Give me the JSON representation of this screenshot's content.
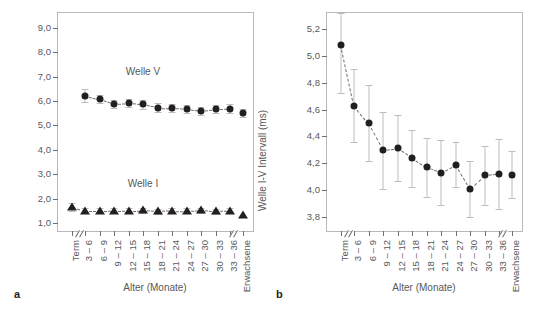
{
  "figure": {
    "panel_a_letter": "a",
    "panel_b_letter": "b"
  },
  "chart_data": [
    {
      "type": "scatter",
      "panel": "a",
      "title": "",
      "xlabel": "Alter (Monate)",
      "ylabel": "Latenz (ms)",
      "ylim": [
        0.6,
        9.6
      ],
      "yticks": [
        "1,0",
        "2,0",
        "3,0",
        "4,0",
        "5,0",
        "6,0",
        "7,0",
        "8,0",
        "9,0"
      ],
      "ytick_values": [
        1.0,
        2.0,
        3.0,
        4.0,
        5.0,
        6.0,
        7.0,
        8.0,
        9.0
      ],
      "grid": false,
      "legend_position": "inline-annotation",
      "axis_break_after_first": true,
      "axis_break_before_last": true,
      "categories": [
        "Term",
        "3 – 6",
        "6 – 9",
        "9 – 12",
        "12 – 15",
        "15 – 18",
        "18 – 21",
        "21 – 24",
        "24 – 27",
        "27 – 30",
        "30 – 33",
        "33 – 36",
        "Erwachsene"
      ],
      "series": [
        {
          "name": "Welle V",
          "marker": "circle",
          "annotation": "Welle V",
          "values": [
            null,
            6.22,
            6.08,
            5.88,
            5.91,
            5.86,
            5.73,
            5.71,
            5.68,
            5.6,
            5.67,
            5.68,
            5.52
          ],
          "err_low": [
            null,
            5.96,
            5.9,
            5.72,
            5.75,
            5.68,
            5.56,
            5.54,
            5.51,
            5.43,
            5.49,
            5.5,
            5.36
          ],
          "err_high": [
            null,
            6.48,
            6.26,
            6.05,
            6.08,
            6.03,
            5.9,
            5.88,
            5.85,
            5.77,
            5.85,
            5.86,
            5.69
          ]
        },
        {
          "name": "Welle I",
          "marker": "triangle",
          "annotation": "Welle I",
          "values": [
            1.66,
            1.5,
            1.5,
            1.51,
            1.52,
            1.53,
            1.49,
            1.52,
            1.5,
            1.53,
            1.48,
            1.5,
            1.34
          ],
          "err_low": [
            1.52,
            1.4,
            1.4,
            1.41,
            1.42,
            1.43,
            1.39,
            1.42,
            1.4,
            1.43,
            1.38,
            1.4,
            1.34
          ],
          "err_high": [
            1.82,
            1.61,
            1.61,
            1.62,
            1.63,
            1.64,
            1.6,
            1.63,
            1.61,
            1.64,
            1.59,
            1.61,
            1.34
          ]
        }
      ]
    },
    {
      "type": "scatter",
      "panel": "b",
      "title": "",
      "xlabel": "Alter (Monate)",
      "ylabel": "Welle I-V Intervall (ms)",
      "ylim": [
        3.68,
        5.32
      ],
      "yticks": [
        "3,8",
        "4,0",
        "4,2",
        "4,4",
        "4,6",
        "4,8",
        "5,0",
        "5,2"
      ],
      "ytick_values": [
        3.8,
        4.0,
        4.2,
        4.4,
        4.6,
        4.8,
        5.0,
        5.2
      ],
      "grid": false,
      "legend_position": "none",
      "axis_break_after_first": true,
      "axis_break_before_last": true,
      "categories": [
        "Term",
        "3 – 6",
        "6 – 9",
        "9 – 12",
        "12 – 15",
        "15 – 18",
        "18 – 21",
        "21 – 24",
        "24 – 27",
        "27 – 30",
        "30 – 33",
        "33 – 36",
        "Erwachsene"
      ],
      "series": [
        {
          "name": "Welle I-V Intervall",
          "marker": "circle",
          "values": [
            5.08,
            4.63,
            4.5,
            4.3,
            4.31,
            4.24,
            4.17,
            4.13,
            4.19,
            4.01,
            4.11,
            4.12,
            4.11
          ],
          "err_low": [
            4.72,
            4.36,
            4.22,
            4.01,
            4.07,
            4.02,
            3.95,
            3.89,
            4.02,
            3.8,
            3.89,
            3.86,
            3.94
          ],
          "err_high": [
            5.32,
            4.9,
            4.78,
            4.58,
            4.56,
            4.45,
            4.39,
            4.37,
            4.36,
            4.22,
            4.33,
            4.38,
            4.29
          ]
        }
      ]
    }
  ]
}
